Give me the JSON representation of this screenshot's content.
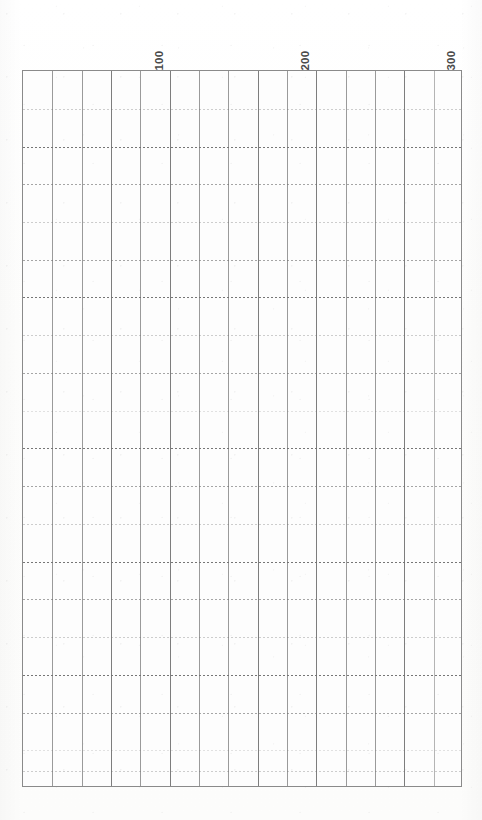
{
  "page": {
    "kind": "scanned-chart-grid",
    "background_color": "#ffffff",
    "paper_color": "#fdfdfd"
  },
  "chart_data": {
    "type": "table",
    "title": "",
    "subtitle": "",
    "xlabel": "",
    "ylabel": "",
    "grid": true,
    "legend": null,
    "annotations": [],
    "series": [],
    "x_tick_labels": [
      "100",
      "200",
      "300"
    ],
    "x_tick_values": [
      100,
      200,
      300
    ],
    "x_tick_rotation_deg": -90,
    "xlim": [
      0,
      300
    ],
    "x_major_step": 100,
    "x_minor_step": 20,
    "y_tick_labels": [],
    "y_tick_values": [],
    "ylim": null,
    "columns": 15,
    "rows": 19,
    "grid_vertical_style": "solid",
    "grid_horizontal_style": "dotted",
    "grid_line_color": "#9a9a9a",
    "grid_dot_color": "#6f6f6f",
    "frame_color": "#8a8a8a",
    "note": "Blank scanned graph/chart grid with no plotted data series."
  },
  "axis": {
    "ticks": [
      {
        "label": "100",
        "value": 100,
        "x_px": 170
      },
      {
        "label": "200",
        "value": 200,
        "x_px": 316
      },
      {
        "label": "300",
        "value": 300,
        "x_px": 462
      }
    ]
  },
  "frame": {
    "left_px": 22,
    "top_px": 70,
    "width_px": 440,
    "height_px": 717,
    "column_width_px": 29.33,
    "row_height_px": 37.74
  },
  "grid_lines": {
    "vertical": [
      {
        "x_px": 29.3,
        "weight": "normal"
      },
      {
        "x_px": 58.7,
        "weight": "normal"
      },
      {
        "x_px": 88.0,
        "weight": "strong"
      },
      {
        "x_px": 117.3,
        "weight": "normal"
      },
      {
        "x_px": 146.7,
        "weight": "strong"
      },
      {
        "x_px": 176.0,
        "weight": "normal"
      },
      {
        "x_px": 205.3,
        "weight": "normal"
      },
      {
        "x_px": 234.7,
        "weight": "strong"
      },
      {
        "x_px": 264.0,
        "weight": "normal"
      },
      {
        "x_px": 293.3,
        "weight": "strong"
      },
      {
        "x_px": 322.7,
        "weight": "normal"
      },
      {
        "x_px": 352.0,
        "weight": "normal"
      },
      {
        "x_px": 381.3,
        "weight": "strong"
      },
      {
        "x_px": 410.7,
        "weight": "faint"
      }
    ],
    "horizontal": [
      {
        "y_px": 37.7,
        "weight": "w-light"
      },
      {
        "y_px": 75.5,
        "weight": "w-dark"
      },
      {
        "y_px": 113.2,
        "weight": "w-mid"
      },
      {
        "y_px": 150.9,
        "weight": "w-light"
      },
      {
        "y_px": 188.7,
        "weight": "w-mid"
      },
      {
        "y_px": 226.4,
        "weight": "w-dark"
      },
      {
        "y_px": 264.2,
        "weight": "w-light"
      },
      {
        "y_px": 301.9,
        "weight": "w-mid"
      },
      {
        "y_px": 339.6,
        "weight": "w-faint"
      },
      {
        "y_px": 377.4,
        "weight": "w-dark"
      },
      {
        "y_px": 415.1,
        "weight": "w-mid"
      },
      {
        "y_px": 452.8,
        "weight": "w-light"
      },
      {
        "y_px": 490.6,
        "weight": "w-dark"
      },
      {
        "y_px": 528.3,
        "weight": "w-mid"
      },
      {
        "y_px": 566.1,
        "weight": "w-light"
      },
      {
        "y_px": 603.8,
        "weight": "w-dark"
      },
      {
        "y_px": 641.5,
        "weight": "w-mid"
      },
      {
        "y_px": 679.3,
        "weight": "w-faint"
      },
      {
        "y_px": 700.0,
        "weight": "w-light"
      }
    ]
  }
}
